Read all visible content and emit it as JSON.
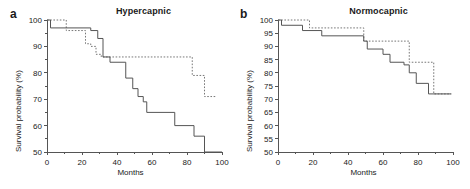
{
  "figure": {
    "background": "#ffffff",
    "axis_color": "#555555",
    "solid_curve_color": "#555555",
    "dashed_curve_color": "#777777"
  },
  "panels": [
    {
      "key": "a",
      "label": "a",
      "title": "Hypercapnic",
      "xlabel": "Months",
      "ylabel": "Survival probability (%)",
      "xticks": [
        0,
        20,
        40,
        60,
        80,
        100
      ],
      "xtick_labels": [
        "0",
        "20",
        "40",
        "60",
        "80",
        "100"
      ],
      "yticks": [
        50,
        60,
        70,
        80,
        90,
        100
      ],
      "ytick_labels": [
        "50",
        "60",
        "70",
        "80",
        "90",
        "100"
      ],
      "xminor": [
        10,
        30,
        50,
        70,
        90
      ],
      "yminor": [
        55,
        65,
        75,
        85,
        95
      ]
    },
    {
      "key": "b",
      "label": "b",
      "title": "Normocapnic",
      "xlabel": "Months",
      "ylabel": "Survival probability (%)",
      "xticks": [
        0,
        20,
        40,
        60,
        80,
        100
      ],
      "xtick_labels": [
        "0",
        "20",
        "40",
        "60",
        "80",
        "100"
      ],
      "yticks": [
        50,
        55,
        60,
        65,
        70,
        75,
        80,
        85,
        90,
        95,
        100
      ],
      "ytick_labels": [
        "50",
        "55",
        "60",
        "65",
        "70",
        "75",
        "80",
        "85",
        "90",
        "95",
        "100"
      ],
      "xminor": [
        10,
        30,
        50,
        70,
        90
      ],
      "yminor": []
    }
  ],
  "chart_data": [
    {
      "type": "line",
      "panel": "a",
      "title": "Hypercapnic",
      "xlabel": "Months",
      "ylabel": "Survival probability (%)",
      "xlim": [
        0,
        100
      ],
      "ylim": [
        50,
        100
      ],
      "grid": false,
      "legend": "none",
      "step": "post",
      "series": [
        {
          "name": "dashed",
          "style": "dashed",
          "x": [
            0,
            11,
            11,
            22,
            22,
            25,
            25,
            28,
            28,
            31,
            31,
            83,
            83,
            90,
            90,
            97
          ],
          "y": [
            100,
            100,
            96,
            96,
            91,
            91,
            90,
            90,
            87,
            87,
            86,
            86,
            79,
            79,
            71,
            71
          ]
        },
        {
          "name": "solid",
          "style": "solid",
          "x": [
            0,
            2,
            2,
            25,
            25,
            29,
            29,
            32,
            32,
            36,
            36,
            45,
            45,
            49,
            49,
            52,
            52,
            55,
            55,
            57,
            57,
            73,
            73,
            84,
            84,
            90,
            90,
            100
          ],
          "y": [
            100,
            100,
            97,
            97,
            96,
            96,
            93,
            93,
            86,
            86,
            84,
            84,
            78,
            78,
            74,
            74,
            71,
            71,
            69,
            69,
            65,
            65,
            60,
            60,
            56,
            56,
            50,
            50
          ]
        }
      ]
    },
    {
      "type": "line",
      "panel": "b",
      "title": "Normocapnic",
      "xlabel": "Months",
      "ylabel": "Survival probability (%)",
      "xlim": [
        0,
        100
      ],
      "ylim": [
        50,
        100
      ],
      "grid": false,
      "legend": "none",
      "step": "post",
      "series": [
        {
          "name": "dashed",
          "style": "dashed",
          "x": [
            0,
            18,
            18,
            49,
            49,
            75,
            75,
            89,
            89,
            99
          ],
          "y": [
            100,
            100,
            97,
            97,
            92,
            92,
            84,
            84,
            72,
            72
          ]
        },
        {
          "name": "solid",
          "style": "solid",
          "x": [
            0,
            2,
            2,
            14,
            14,
            25,
            25,
            49,
            49,
            51,
            51,
            60,
            60,
            64,
            64,
            72,
            72,
            75,
            75,
            79,
            79,
            86,
            86,
            99
          ],
          "y": [
            100,
            100,
            98,
            98,
            96,
            96,
            94,
            94,
            92,
            92,
            89,
            89,
            87,
            87,
            84,
            84,
            83,
            83,
            80,
            80,
            76,
            76,
            72,
            72
          ]
        }
      ]
    }
  ]
}
